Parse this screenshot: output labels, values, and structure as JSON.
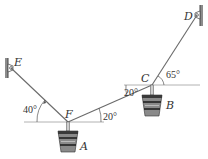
{
  "figure": {
    "colors": {
      "cable": "#6a6a6a",
      "reference_line": "#9a9a9a",
      "wall": "#555555",
      "text": "#333333",
      "bucket_dark": "#2e2e2e",
      "bucket_light": "#9a9a9a"
    },
    "points": {
      "E": {
        "label": "E",
        "x": 11,
        "y": 68
      },
      "F": {
        "label": "F",
        "x": 68,
        "y": 122
      },
      "C": {
        "label": "C",
        "x": 152,
        "y": 85
      },
      "D": {
        "label": "D",
        "x": 197,
        "y": 15
      }
    },
    "segments": [
      {
        "name": "cable-EF",
        "from": "E",
        "to": "F"
      },
      {
        "name": "cable-FC",
        "from": "F",
        "to": "C"
      },
      {
        "name": "cable-CD",
        "from": "C",
        "to": "D"
      }
    ],
    "angles": {
      "angle_EF": {
        "label": "40°",
        "description": "angle of EF below horizontal at F"
      },
      "angle_FC_at_F": {
        "label": "20°",
        "description": "angle of FC above horizontal at F"
      },
      "angle_FC_at_C": {
        "label": "20°",
        "description": "angle of FC below horizontal at C"
      },
      "angle_CD": {
        "label": "65°",
        "description": "angle of CD above horizontal at C"
      }
    },
    "loads": {
      "A": {
        "label": "A",
        "hangs_from": "F"
      },
      "B": {
        "label": "B",
        "hangs_from": "C"
      }
    },
    "supports": {
      "E": {
        "type": "wall-pin",
        "side": "left"
      },
      "D": {
        "type": "wall-pin",
        "side": "right"
      }
    }
  }
}
